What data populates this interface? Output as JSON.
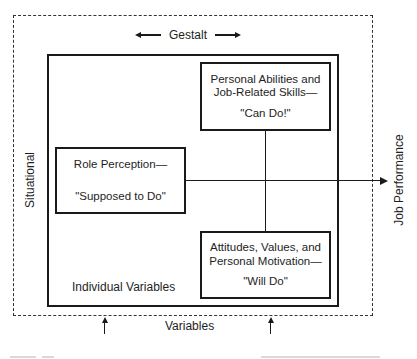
{
  "diagram": {
    "top_label": "Gestalt",
    "left_label": "Situational",
    "right_output_label": "Job Performance",
    "bottom_label": "Variables",
    "inner_region_label": "Individual Variables",
    "boxes": {
      "can_do": {
        "title_line1": "Personal Abilities and",
        "title_line2": "Job-Related Skills—",
        "quote": "\"Can Do!\""
      },
      "role": {
        "title_line1": "Role Perception—",
        "quote": "\"Supposed to Do\""
      },
      "will_do": {
        "title_line1": "Attitudes, Values, and",
        "title_line2": "Personal Motivation—",
        "quote": "\"Will Do\""
      }
    },
    "colors": {
      "line": "#1a1a1a",
      "background": "#ffffff"
    }
  }
}
